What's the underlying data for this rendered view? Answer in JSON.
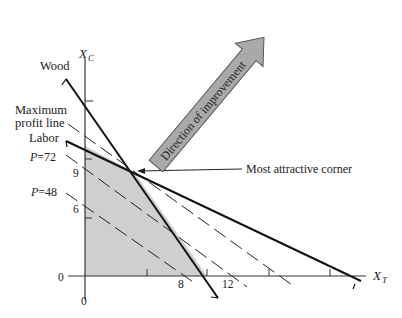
{
  "diagram": {
    "type": "linear-programming-graph",
    "axes": {
      "y_label": "X",
      "y_label_sub": "C",
      "x_label": "X",
      "x_label_sub": "T",
      "origin_x_label": "0",
      "origin_y_label": "0",
      "y_ticks": [
        {
          "value": "6"
        },
        {
          "value": "9"
        }
      ],
      "x_ticks": [
        {
          "value": "8"
        },
        {
          "value": "12"
        }
      ]
    },
    "constraints": [
      {
        "name": "Wood",
        "label": "Wood"
      },
      {
        "name": "Labor",
        "label": "Labor"
      }
    ],
    "profit_lines": [
      {
        "label": "P = 48",
        "text": "P =48"
      },
      {
        "label": "P = 72",
        "text": "P =72"
      },
      {
        "label": "Maximum profit line",
        "line1": "Maximum",
        "line2": "profit line"
      }
    ],
    "annotations": {
      "corner": "Most attractive corner",
      "arrow": "Direction of improvement"
    },
    "colors": {
      "feasible_region": "#cfcfcf",
      "arrow_fill": "#a9a9a9",
      "line": "#1a1a1a"
    }
  }
}
